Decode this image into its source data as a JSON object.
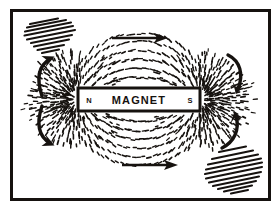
{
  "figure": {
    "background_color": "#ffffff",
    "ink_color": "#16120f",
    "frame": {
      "name": "outer frame border",
      "x": 10,
      "y": 9,
      "width": 261,
      "height": 192,
      "stroke_width": 3,
      "color": "#16120f"
    }
  },
  "magnet": {
    "body_label": "MAGNET",
    "north_pole_label": "N",
    "south_pole_label": "S",
    "fill_color": "#ffffff",
    "stroke_color": "#16120f",
    "x": 78,
    "y": 88,
    "width": 122,
    "height": 23
  },
  "field": {
    "description": "Iron filings aligned along magnetic flux lines",
    "filing_color": "#16120f",
    "arc_count": 7,
    "pole_ray_count": 22
  },
  "annotations": {
    "straight_arrows": [
      {
        "name": "top-direction-arrow",
        "direction": "right",
        "x1": 112,
        "y1": 38,
        "x2": 168,
        "y2": 38
      },
      {
        "name": "bottom-direction-arrow",
        "direction": "right",
        "x1": 122,
        "y1": 165,
        "x2": 178,
        "y2": 165
      }
    ],
    "curved_arrows": [
      {
        "name": "upper-left-flux-arrow",
        "direction": "up-left",
        "quadrant": "upper-left"
      },
      {
        "name": "lower-left-flux-arrow",
        "direction": "down-left",
        "quadrant": "lower-left"
      },
      {
        "name": "upper-right-flux-arrow",
        "direction": "down-right",
        "quadrant": "upper-right"
      },
      {
        "name": "lower-right-flux-arrow",
        "direction": "up-right",
        "quadrant": "lower-right"
      }
    ],
    "hatch_regions": [
      {
        "name": "top-left-hatch",
        "corner": "top-left",
        "line_count": 9,
        "angle_deg": -25
      },
      {
        "name": "bottom-right-hatch",
        "corner": "bottom-right",
        "line_count": 11,
        "angle_deg": -25
      }
    ]
  }
}
